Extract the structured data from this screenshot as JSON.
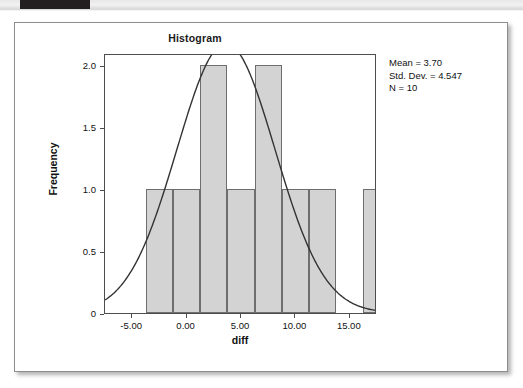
{
  "window": {
    "top_tab_color": "#231f20",
    "band_color": "#eeeeee"
  },
  "card": {
    "background": "#ffffff",
    "border_color": "#8d8d8d"
  },
  "chart_data": {
    "type": "bar",
    "title": "Histogram",
    "xlabel": "diff",
    "ylabel": "Frequency",
    "xlim": [
      -7.5,
      17.5
    ],
    "ylim": [
      0,
      2.1
    ],
    "grid": false,
    "legend": null,
    "bin_width": 2.5,
    "bar_fill": "#d3d3d3",
    "bar_stroke": "#6e6e6e",
    "curve_color": "#333333",
    "categories": [
      "-3.75",
      "-1.25",
      "1.25",
      "3.75",
      "6.25",
      "8.75",
      "11.25",
      "13.75"
    ],
    "bins": [
      {
        "left": -3.75,
        "right": -1.25,
        "center": -2.5,
        "value": 1
      },
      {
        "left": -1.25,
        "right": 1.25,
        "center": 0.0,
        "value": 1
      },
      {
        "left": 1.25,
        "right": 3.75,
        "center": 2.5,
        "value": 2
      },
      {
        "left": 3.75,
        "right": 6.25,
        "center": 5.0,
        "value": 1
      },
      {
        "left": 6.25,
        "right": 8.75,
        "center": 7.5,
        "value": 2
      },
      {
        "left": 8.75,
        "right": 11.25,
        "center": 10.0,
        "value": 1
      },
      {
        "left": 11.25,
        "right": 13.75,
        "center": 12.5,
        "value": 1
      },
      {
        "left": 16.25,
        "right": 18.75,
        "center": 17.5,
        "value": 1
      }
    ],
    "values": [
      1,
      1,
      2,
      1,
      2,
      1,
      1,
      1
    ],
    "normal_curve": {
      "mean": 3.7,
      "std_dev": 4.547,
      "n": 10,
      "peak_frequency": 1.75
    },
    "y_ticks": [
      "0",
      "0.5",
      "1.0",
      "1.5",
      "2.0"
    ],
    "y_tick_values": [
      0,
      0.5,
      1.0,
      1.5,
      2.0
    ],
    "x_ticks": [
      "-5.00",
      "0.00",
      "5.00",
      "10.00",
      "15.00"
    ],
    "x_tick_values": [
      -5,
      0,
      5,
      10,
      15
    ]
  },
  "stats": {
    "mean": "Mean = 3.70",
    "std_dev": "Std. Dev. = 4.547",
    "n": "N = 10"
  }
}
